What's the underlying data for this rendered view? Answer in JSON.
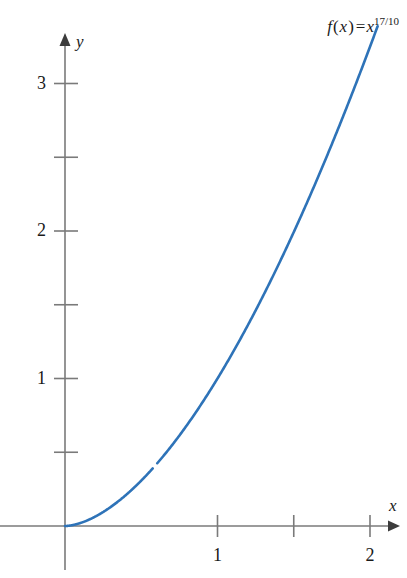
{
  "figure": {
    "width": 407,
    "height": 578,
    "background": "#ffffff"
  },
  "annotation": {
    "function_name": "f",
    "variable": "x",
    "equals": "=",
    "base": "x",
    "exponent": "17/10",
    "full_text": "f(x) = x^17/10"
  },
  "axes": {
    "x_axis_label": "x",
    "y_axis_label": "y",
    "axis_color": "#7a7a7a",
    "origin_px": {
      "x": 65,
      "y": 526
    },
    "x_unit_px": 152.5,
    "y_unit_px": 147.5,
    "x_ticks": [
      {
        "value": 1,
        "label": "1",
        "labeled": true
      },
      {
        "value": 1.5,
        "label": "",
        "labeled": false
      },
      {
        "value": 2,
        "label": "2",
        "labeled": true
      }
    ],
    "y_ticks": [
      {
        "value": 0.5,
        "label": "",
        "labeled": false
      },
      {
        "value": 1,
        "label": "1",
        "labeled": true
      },
      {
        "value": 1.5,
        "label": "",
        "labeled": false
      },
      {
        "value": 2,
        "label": "2",
        "labeled": true
      },
      {
        "value": 2.5,
        "label": "",
        "labeled": false
      },
      {
        "value": 3,
        "label": "3",
        "labeled": true
      }
    ]
  },
  "chart_data": {
    "type": "line",
    "title": "",
    "subtitle": "",
    "xlabel": "x",
    "ylabel": "y",
    "xlim": [
      0,
      2.1
    ],
    "ylim": [
      0,
      3.4
    ],
    "grid": false,
    "legend": null,
    "annotations": [
      {
        "text": "f(x) = x^17/10",
        "position": "top-right"
      }
    ],
    "xticks": [
      1,
      2
    ],
    "xticks_minor": [
      1.5
    ],
    "yticks": [
      1,
      2,
      3
    ],
    "yticks_minor": [
      0.5,
      1.5,
      2.5
    ],
    "series": [
      {
        "name": "f(x) = x^17/10",
        "color": "#2e73b8",
        "linewidth": 2.6,
        "expression": "x^(17/10)",
        "x": [
          0,
          0.05,
          0.1,
          0.15,
          0.2,
          0.25,
          0.3,
          0.35,
          0.4,
          0.45,
          0.5,
          0.55,
          0.6,
          0.65,
          0.7,
          0.75,
          0.8,
          0.85,
          0.9,
          0.95,
          1.0,
          1.05,
          1.1,
          1.15,
          1.2,
          1.25,
          1.3,
          1.35,
          1.4,
          1.45,
          1.5,
          1.55,
          1.6,
          1.65,
          1.7,
          1.75,
          1.8,
          1.85,
          1.9,
          1.95,
          2.0,
          2.05
        ],
        "y": [
          0,
          0.0063,
          0.0204,
          0.0404,
          0.0659,
          0.0966,
          0.1322,
          0.1726,
          0.2175,
          0.267,
          0.3078,
          0.3785,
          0.4406,
          0.5068,
          0.5771,
          0.6515,
          0.7298,
          0.812,
          0.8981,
          0.988,
          1.0,
          1.1788,
          1.2797,
          1.3842,
          1.4921,
          1.6035,
          1.7183,
          1.8365,
          1.958,
          2.0828,
          2.2109,
          2.3422,
          2.4768,
          2.6146,
          2.7555,
          2.8996,
          3.0468,
          3.1971,
          3.3505,
          3.5069,
          3.249,
          3.37
        ]
      }
    ]
  },
  "curve_render": {
    "color": "#2e73b8",
    "width": 2.6,
    "exponent_num": 17,
    "exponent_den": 10,
    "x_start": 0,
    "x_end": 2.05,
    "gap": {
      "x_from": 0.575,
      "x_to": 0.605
    }
  }
}
